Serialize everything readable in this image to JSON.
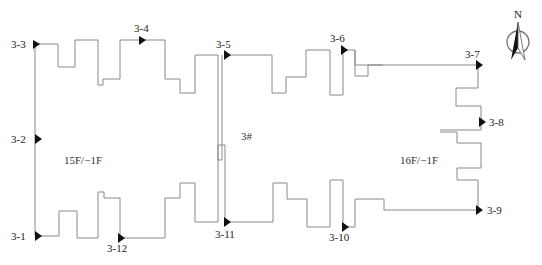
{
  "diagram": {
    "building_labels": {
      "left": "15F/−1F",
      "center": "3#",
      "right": "16F/−1F"
    },
    "compass": {
      "label": "N"
    },
    "points": [
      {
        "id": "3-1",
        "label": "3-1"
      },
      {
        "id": "3-2",
        "label": "3-2"
      },
      {
        "id": "3-3",
        "label": "3-3"
      },
      {
        "id": "3-4",
        "label": "3-4"
      },
      {
        "id": "3-5",
        "label": "3-5"
      },
      {
        "id": "3-6",
        "label": "3-6"
      },
      {
        "id": "3-7",
        "label": "3-7"
      },
      {
        "id": "3-8",
        "label": "3-8"
      },
      {
        "id": "3-9",
        "label": "3-9"
      },
      {
        "id": "3-10",
        "label": "3-10"
      },
      {
        "id": "3-11",
        "label": "3-11"
      },
      {
        "id": "3-12",
        "label": "3-12"
      }
    ]
  }
}
